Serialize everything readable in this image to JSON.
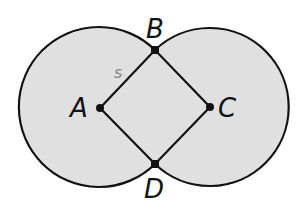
{
  "diagram": {
    "type": "geometry",
    "colors": {
      "fill": "#e0e0e0",
      "stroke": "#111111",
      "side_label": "#888888"
    },
    "points": {
      "A": {
        "label": "A",
        "x": 100,
        "y": 108
      },
      "B": {
        "label": "B",
        "x": 155,
        "y": 50
      },
      "C": {
        "label": "C",
        "x": 210,
        "y": 107
      },
      "D": {
        "label": "D",
        "x": 155,
        "y": 164
      }
    },
    "circles": [
      {
        "center": "A",
        "r": 80
      },
      {
        "center": "C",
        "r": 79
      }
    ],
    "segments": [
      [
        "A",
        "B"
      ],
      [
        "B",
        "C"
      ],
      [
        "C",
        "D"
      ],
      [
        "D",
        "A"
      ]
    ],
    "side_label": {
      "text": "s",
      "on_segment": "AB"
    }
  }
}
